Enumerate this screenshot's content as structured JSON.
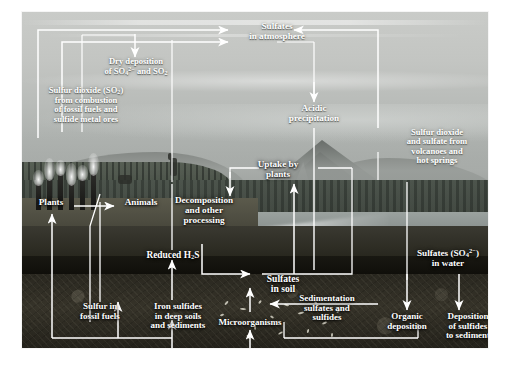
{
  "figure": {
    "alt": "Photographic montage of a volcano, lake, forest, soil profile and industrial smokestacks overlaid with white arrows and labels depicting the global sulfur cycle"
  },
  "colors": {
    "label_text": "#ffffff",
    "arrow": "#ffffff",
    "sky": "#c5c7c4",
    "soil": "#2a2820",
    "water": "#868d8b"
  },
  "labels": [
    {
      "id": "sulfates-in-atmosphere",
      "text": "Sulfates\nin atmosphere",
      "size": 9.2
    },
    {
      "id": "dry-deposition",
      "text": "Dry deposition\nof SO₄²⁻ and SO₂",
      "size": 8.6
    },
    {
      "id": "sulfur-dioxide-combustion",
      "text": "Sulfur dioxide (SO₂)\nfrom combustion\nof fossil fuels and\nsulfide metal ores",
      "size": 8.6
    },
    {
      "id": "acidic-precipitation",
      "text": "Acidic\nprecipitation",
      "size": 9.2
    },
    {
      "id": "sulfur-dioxide-volcanoes",
      "text": "Sulfur dioxide\nand sulfate from\nvolcanoes and\nhot springs",
      "size": 8.6
    },
    {
      "id": "uptake-by-plants",
      "text": "Uptake by\nplants",
      "size": 9.2
    },
    {
      "id": "plants",
      "text": "Plants",
      "size": 9.2
    },
    {
      "id": "animals",
      "text": "Animals",
      "size": 9.2
    },
    {
      "id": "decomposition",
      "text": "Decomposition\nand other\nprocessing",
      "size": 9.2
    },
    {
      "id": "reduced-h2s",
      "text": "Reduced H₂S",
      "size": 9.4
    },
    {
      "id": "sulfates-in-soil",
      "text": "Sulfates\nin soil",
      "size": 9.6
    },
    {
      "id": "sulfates-in-water",
      "text": "Sulfates (SO₄²⁻)\nin water",
      "size": 9.2
    },
    {
      "id": "sulfur-in-fossil-fuels",
      "text": "Sulfur in\nfossil fuels",
      "size": 9.0
    },
    {
      "id": "iron-sulfides",
      "text": "Iron sulfides\nin deep soils\nand sediments",
      "size": 9.0
    },
    {
      "id": "microorganisms",
      "text": "Microorganisms",
      "size": 9.0
    },
    {
      "id": "sedimentation",
      "text": "Sedimentation\nsulfates and\nsulfides",
      "size": 9.0
    },
    {
      "id": "organic-deposition",
      "text": "Organic\ndeposition",
      "size": 9.0
    },
    {
      "id": "deposition-of-sulfides",
      "text": "Deposition\nof sulfides\nto sediment",
      "size": 9.0
    }
  ],
  "flows": [
    {
      "from": "sulfur-dioxide-combustion",
      "to": "sulfates-in-atmosphere"
    },
    {
      "from": "sulfur-dioxide-combustion",
      "to": "dry-deposition"
    },
    {
      "from": "sulfur-dioxide-volcanoes",
      "to": "sulfates-in-atmosphere"
    },
    {
      "from": "sulfates-in-atmosphere",
      "to": "acidic-precipitation"
    },
    {
      "from": "acidic-precipitation",
      "to": "sulfates-in-soil"
    },
    {
      "from": "dry-deposition",
      "to": "plants-animals-ground"
    },
    {
      "from": "sulfates-in-soil",
      "to": "uptake-by-plants"
    },
    {
      "from": "uptake-by-plants",
      "to": "decomposition"
    },
    {
      "from": "plants",
      "to": "animals"
    },
    {
      "from": "animals",
      "to": "decomposition"
    },
    {
      "from": "decomposition",
      "to": "sulfates-in-soil"
    },
    {
      "from": "reduced-h2s",
      "to": "decomposition"
    },
    {
      "from": "iron-sulfides",
      "to": "reduced-h2s"
    },
    {
      "from": "microorganisms",
      "to": "sulfates-in-soil"
    },
    {
      "from": "sulfates-in-water",
      "to": "deposition-of-sulfides"
    },
    {
      "from": "sedimentation",
      "to": "sulfates-in-soil"
    },
    {
      "from": "organic-deposition",
      "to": "sediment"
    },
    {
      "from": "sulfur-in-fossil-fuels",
      "to": "plants"
    }
  ]
}
